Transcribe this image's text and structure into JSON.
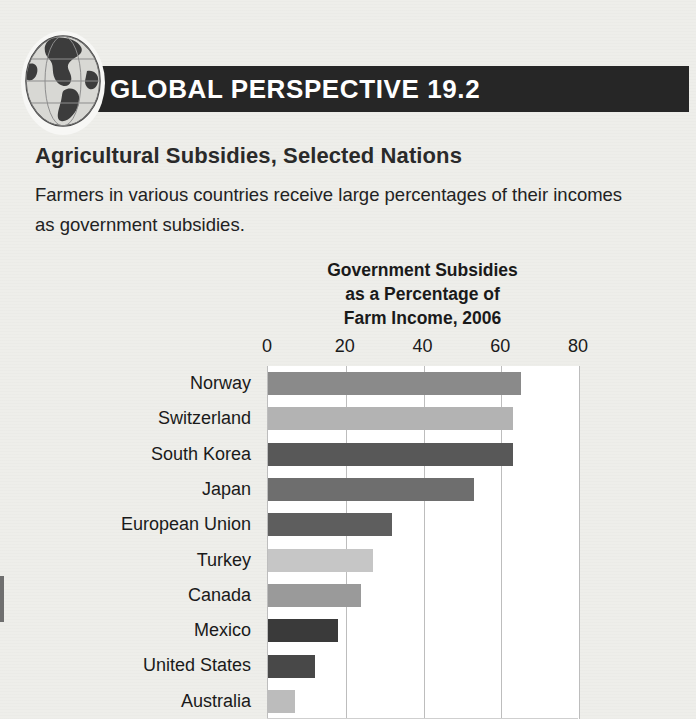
{
  "header": {
    "badge_title": "GLOBAL PERSPECTIVE 19.2",
    "globe_icon": "globe-americas-icon",
    "band_color": "#262626",
    "title_color": "#ffffff"
  },
  "section": {
    "title": "Agricultural Subsidies, Selected Nations",
    "body": "Farmers in various countries receive large percentages of their incomes as government subsidies."
  },
  "chart_data": {
    "type": "bar",
    "orientation": "horizontal",
    "title": "Government Subsidies\nas a Percentage of\nFarm Income, 2006",
    "title_lines": [
      "Government Subsidies",
      "as a Percentage of",
      "Farm Income, 2006"
    ],
    "xlabel": "",
    "ylabel": "",
    "xlim": [
      0,
      80
    ],
    "ylim": null,
    "grid": true,
    "grid_axis": "x",
    "legend": null,
    "tick_labels": [
      "0",
      "20",
      "40",
      "60",
      "80"
    ],
    "ticks": [
      0,
      20,
      40,
      60,
      80
    ],
    "categories": [
      "Norway",
      "Switzerland",
      "South Korea",
      "Japan",
      "European Union",
      "Turkey",
      "Canada",
      "Mexico",
      "United States",
      "Australia"
    ],
    "values": [
      65,
      63,
      63,
      53,
      32,
      27,
      24,
      18,
      12,
      7
    ],
    "bar_colors": [
      "#8a8a8a",
      "#b3b3b3",
      "#585858",
      "#6e6e6e",
      "#5e5e5e",
      "#c6c6c6",
      "#9a9a9a",
      "#3a3a3a",
      "#484848",
      "#bcbcbc"
    ],
    "plot_background": "#ffffff",
    "gridline_color": "#bdbdbd"
  }
}
